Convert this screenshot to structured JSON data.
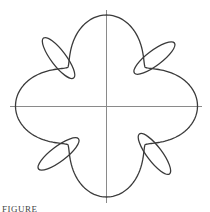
{
  "figure": {
    "caption": "FIGURE",
    "colors": {
      "curve": "#3a3a3a",
      "axes": "#8a8a8a",
      "background": "#ffffff"
    },
    "curve_shape": {
      "lobes": 4,
      "lobe_directions_deg": [
        0,
        90,
        180,
        270
      ],
      "loop_directions_deg": [
        45,
        135,
        225,
        315
      ],
      "min_radius_fraction": 0.6,
      "loop_outer_radius_fraction": 1.02,
      "loop_inner_radius_fraction": 0.47
    }
  }
}
